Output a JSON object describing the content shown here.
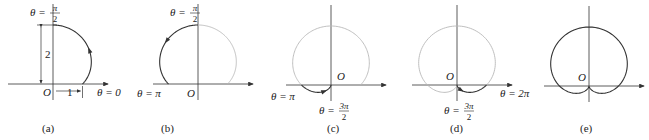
{
  "figure": {
    "scale_px_per_unit": 29.5,
    "colors": {
      "traced": "#333333",
      "ghost": "#b8b8b8",
      "axis": "#333333"
    },
    "panels": [
      {
        "id": "a",
        "caption": "(a)",
        "origin": [
          53,
          84
        ],
        "caption_x": 42,
        "theta_range_traced": [
          0,
          1.5708
        ],
        "show_ghost": false,
        "arrow_at_theta": 0.75,
        "labels": {
          "top": {
            "lhs": "θ = ",
            "num": "π",
            "den": "2",
            "x": 30,
            "y": 12
          },
          "origin": {
            "text": "O",
            "x": 43,
            "y": 96
          },
          "right": {
            "text": "θ = 0",
            "x": 97,
            "y": 96
          },
          "dim_vertical": {
            "text": "2",
            "x": 45,
            "y": 58
          },
          "dim_horizontal": {
            "text": "1",
            "x": 67,
            "y": 96
          }
        }
      },
      {
        "id": "b",
        "caption": "(b)",
        "origin": [
          198,
          84
        ],
        "caption_x": 161,
        "theta_range_traced": [
          1.5708,
          3.1416
        ],
        "show_ghost": true,
        "ghost_range": [
          0,
          1.5708
        ],
        "arrow_at_theta": 2.2,
        "labels": {
          "top": {
            "lhs": "θ = ",
            "num": "π",
            "den": "2",
            "x": 170,
            "y": 12
          },
          "origin": {
            "text": "O",
            "x": 187,
            "y": 97
          },
          "left": {
            "text": "θ = π",
            "x": 137,
            "y": 97
          }
        }
      },
      {
        "id": "c",
        "caption": "(c)",
        "origin": [
          331,
          85
        ],
        "caption_x": 327,
        "theta_range_traced": [
          3.1416,
          4.7124
        ],
        "show_ghost": true,
        "ghost_range": [
          0,
          3.1416
        ],
        "arrow_at_theta": 3.9,
        "labels": {
          "origin": {
            "text": "O",
            "x": 337,
            "y": 80
          },
          "left": {
            "text": "θ = π",
            "x": 271,
            "y": 100
          },
          "bottom": {
            "lhs": "θ = ",
            "num": "3π",
            "den": "2",
            "x": 319,
            "y": 110
          }
        }
      },
      {
        "id": "d",
        "caption": "(d)",
        "origin": [
          457,
          85
        ],
        "caption_x": 450,
        "theta_range_traced": [
          4.7124,
          6.2832
        ],
        "show_ghost": true,
        "ghost_range": [
          0,
          4.7124
        ],
        "arrow_at_theta": 5.4,
        "labels": {
          "origin": {
            "text": "O",
            "x": 446,
            "y": 80
          },
          "right": {
            "text": "θ = 2π",
            "x": 500,
            "y": 97
          },
          "bottom": {
            "lhs": "θ = ",
            "num": "3π",
            "den": "2",
            "x": 444,
            "y": 110
          }
        }
      },
      {
        "id": "e",
        "caption": "(e)",
        "origin": [
          589,
          86
        ],
        "caption_x": 580,
        "theta_range_traced": [
          0,
          6.2832
        ],
        "show_ghost": false,
        "arrow_at_theta": null,
        "labels": {
          "origin": {
            "text": "O",
            "x": 578,
            "y": 81
          }
        }
      }
    ]
  }
}
